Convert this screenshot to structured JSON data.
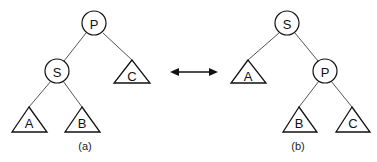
{
  "diagram": {
    "type": "tree-rotation",
    "relation_arrow": "bidirectional",
    "trees": [
      {
        "caption": "(a)",
        "root": "P",
        "nodes": [
          {
            "id": "P",
            "label": "P",
            "shape": "circle",
            "children": [
              "S",
              "C"
            ]
          },
          {
            "id": "S",
            "label": "S",
            "shape": "circle",
            "children": [
              "A",
              "B"
            ]
          },
          {
            "id": "C",
            "label": "C",
            "shape": "triangle"
          },
          {
            "id": "A",
            "label": "A",
            "shape": "triangle"
          },
          {
            "id": "B",
            "label": "B",
            "shape": "triangle"
          }
        ]
      },
      {
        "caption": "(b)",
        "root": "S",
        "nodes": [
          {
            "id": "S",
            "label": "S",
            "shape": "circle",
            "children": [
              "A",
              "P"
            ]
          },
          {
            "id": "A",
            "label": "A",
            "shape": "triangle"
          },
          {
            "id": "P",
            "label": "P",
            "shape": "circle",
            "children": [
              "B",
              "C"
            ]
          },
          {
            "id": "B",
            "label": "B",
            "shape": "triangle"
          },
          {
            "id": "C",
            "label": "C",
            "shape": "triangle"
          }
        ]
      }
    ]
  },
  "labels": {
    "a": {
      "P": "P",
      "S": "S",
      "A": "A",
      "B": "B",
      "C": "C",
      "caption": "(a)"
    },
    "b": {
      "S": "S",
      "A": "A",
      "P": "P",
      "B": "B",
      "C": "C",
      "caption": "(b)"
    }
  },
  "colors": {
    "stroke": "#111111",
    "edge": "#555555",
    "background": "#ffffff"
  }
}
